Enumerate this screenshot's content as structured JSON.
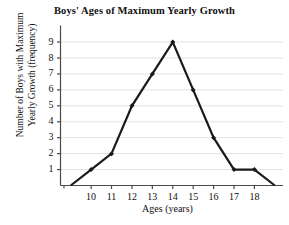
{
  "chart_data": {
    "type": "line",
    "title": "Boys' Ages of Maximum Yearly Growth",
    "xlabel": "Ages (years)",
    "ylabel_line1": "Number of Boys with Maximum",
    "ylabel_line2": "Yearly Growth (frequency)",
    "x": [
      9,
      10,
      11,
      12,
      13,
      14,
      15,
      16,
      17,
      18,
      19
    ],
    "values": [
      0,
      1,
      2,
      5,
      7,
      9,
      6,
      3,
      1,
      1,
      0
    ],
    "xticks": [
      10,
      11,
      12,
      13,
      14,
      15,
      16,
      17,
      18
    ],
    "xtick_labels": [
      "10",
      "11",
      "12",
      "13",
      "14",
      "15",
      "16",
      "17",
      "18"
    ],
    "yticks": [
      1,
      2,
      3,
      4,
      5,
      6,
      7,
      8,
      9
    ],
    "ytick_labels": [
      "1",
      "2",
      "3",
      "4",
      "5",
      "6",
      "7",
      "8",
      "9"
    ],
    "xlim": [
      8.5,
      19.4
    ],
    "ylim": [
      0,
      9.6
    ],
    "grid": true,
    "grid_axis": "y",
    "legend": false,
    "marker": "diamond",
    "line_color": "#1a1a1a",
    "grid_color": "#e2e2e2",
    "axis_color": "#4a4a4a",
    "background_color": "#ffffff"
  }
}
